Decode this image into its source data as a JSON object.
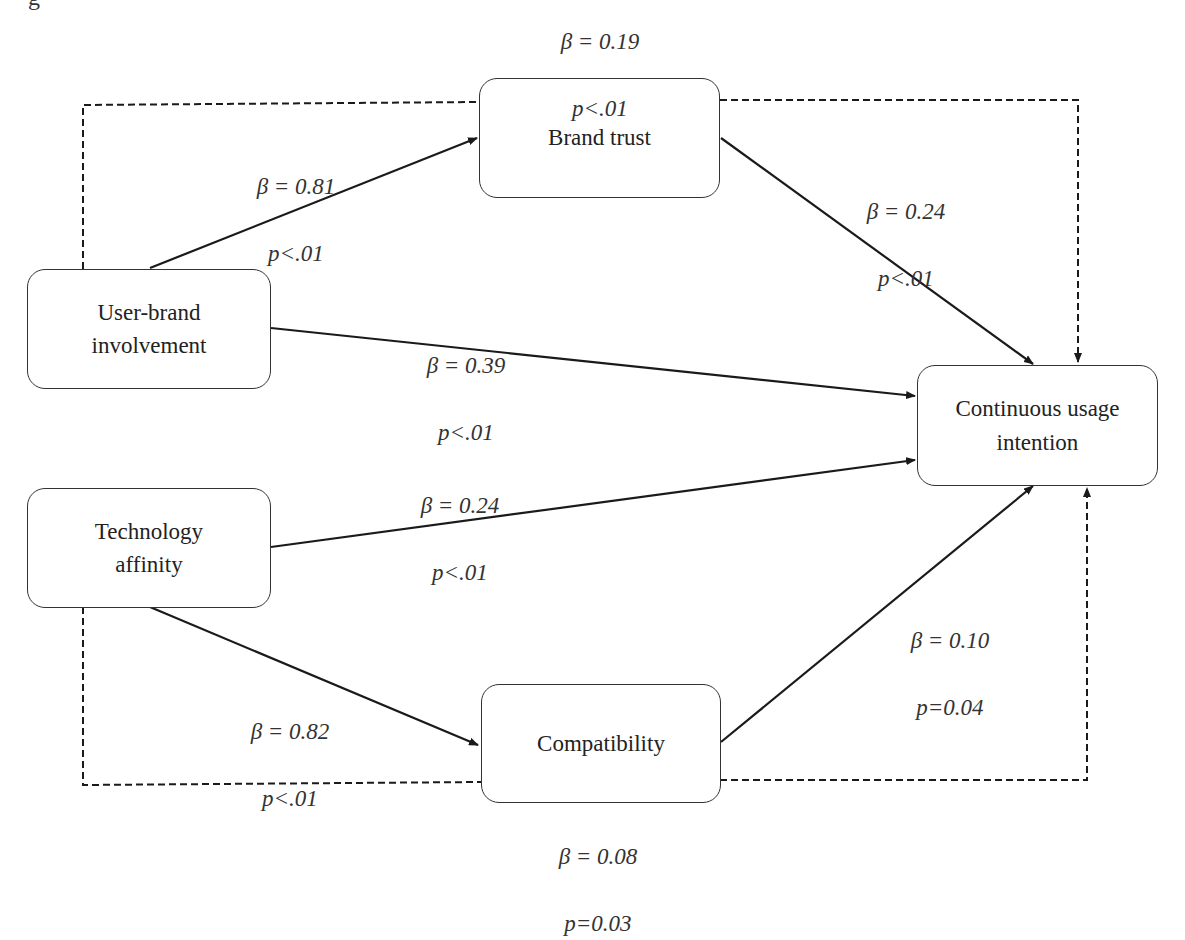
{
  "figure": {
    "title_fragment": "g"
  },
  "nodes": {
    "brand_trust": {
      "label": "Brand trust"
    },
    "user_brand_involvement": {
      "label": "User-brand\ninvolvement"
    },
    "technology_affinity": {
      "label": "Technology\naffinity"
    },
    "compatibility": {
      "label": "Compatibility"
    },
    "continuous_usage_intention": {
      "label": "Continuous usage\nintention"
    }
  },
  "paths": {
    "ubi_to_bt": {
      "beta": "β = 0.81",
      "p": "p<.01"
    },
    "bt_to_cui": {
      "beta": "β = 0.24",
      "p": "p<.01"
    },
    "ubi_to_cui": {
      "beta": "β = 0.39",
      "p": "p<.01"
    },
    "ta_to_cui": {
      "beta": "β = 0.24",
      "p": "p<.01"
    },
    "ta_to_comp": {
      "beta": "β = 0.82",
      "p": "p<.01"
    },
    "comp_to_cui": {
      "beta": "β = 0.10",
      "p": "p=0.04"
    },
    "indirect_ubi_via_bt": {
      "beta": "β = 0.19",
      "p": "p<.01"
    },
    "indirect_ta_via_comp": {
      "beta": "β = 0.08",
      "p": "p=0.03"
    }
  },
  "colors": {
    "line": "#1a1a1a",
    "box_border": "#333333",
    "text": "#222222"
  }
}
